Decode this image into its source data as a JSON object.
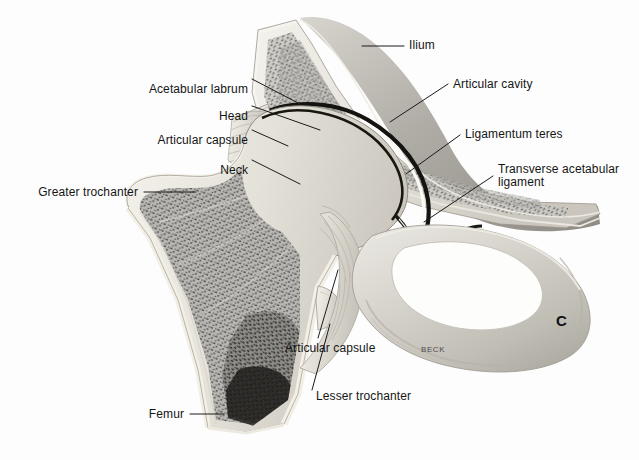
{
  "figure": {
    "panel_label": "C",
    "artist_signature": "BECK",
    "background_color": "#fdfdfd",
    "text_color": "#151515",
    "leader_line_color": "#1a1a1a"
  },
  "labels": [
    {
      "id": "acetabular-labrum",
      "text": "Acetabular labrum",
      "align": "right",
      "x": 248,
      "y": 83,
      "lines": 1
    },
    {
      "id": "head",
      "text": "Head",
      "align": "right",
      "x": 248,
      "y": 110,
      "lines": 1
    },
    {
      "id": "articular-capsule-upper",
      "text": "Articular capsule",
      "align": "right",
      "x": 248,
      "y": 134,
      "lines": 1
    },
    {
      "id": "neck",
      "text": "Neck",
      "align": "right",
      "x": 248,
      "y": 164,
      "lines": 1
    },
    {
      "id": "greater-trochanter",
      "text": "Greater trochanter",
      "align": "right",
      "x": 138,
      "y": 187,
      "lines": 1
    },
    {
      "id": "femur",
      "text": "Femur",
      "align": "right",
      "x": 184,
      "y": 409,
      "lines": 1
    },
    {
      "id": "ilium",
      "text": "Ilium",
      "align": "left",
      "x": 409,
      "y": 40,
      "lines": 1
    },
    {
      "id": "articular-cavity",
      "text": "Articular cavity",
      "align": "left",
      "x": 453,
      "y": 82,
      "lines": 1
    },
    {
      "id": "ligamentum-teres",
      "text": "Ligamentum teres",
      "align": "left",
      "x": 465,
      "y": 133,
      "lines": 1
    },
    {
      "id": "transverse-acetabular",
      "text": "Transverse acetabular\nligament",
      "align": "left",
      "x": 498,
      "y": 163,
      "lines": 2
    },
    {
      "id": "articular-capsule-lower",
      "text": "Articular capsule",
      "align": "left",
      "x": 285,
      "y": 342,
      "lines": 1
    },
    {
      "id": "lesser-trochanter",
      "text": "Lesser trochanter",
      "align": "left",
      "x": 316,
      "y": 390,
      "lines": 1
    }
  ],
  "anatomy_parts": [
    {
      "id": "ilium-bone",
      "name": "Ilium"
    },
    {
      "id": "femoral-head",
      "name": "Head of femur"
    },
    {
      "id": "femoral-neck",
      "name": "Neck of femur"
    },
    {
      "id": "greater-trochanter",
      "name": "Greater trochanter"
    },
    {
      "id": "lesser-trochanter",
      "name": "Lesser trochanter"
    },
    {
      "id": "femoral-shaft",
      "name": "Femur shaft"
    },
    {
      "id": "acetabular-labrum",
      "name": "Acetabular labrum"
    },
    {
      "id": "articular-cavity",
      "name": "Articular cavity"
    },
    {
      "id": "ligamentum-teres",
      "name": "Ligamentum teres"
    },
    {
      "id": "transverse-ligament",
      "name": "Transverse acetabular ligament"
    },
    {
      "id": "articular-capsule",
      "name": "Articular capsule"
    },
    {
      "id": "obturator-foramen",
      "name": "Obturator foramen"
    },
    {
      "id": "pubis-ischium",
      "name": "Pubis and ischium ring"
    }
  ]
}
